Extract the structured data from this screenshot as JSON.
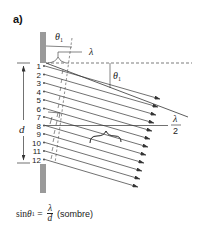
{
  "panel_label": "a)",
  "labels": {
    "theta_top": "θ",
    "theta_top_sub": "1",
    "lambda": "λ",
    "theta_mid": "θ",
    "theta_mid_sub": "1",
    "d": "d",
    "half_lambda_num": "λ",
    "half_lambda_den": "2"
  },
  "sources": [
    "1",
    "2",
    "3",
    "4",
    "5",
    "6",
    "7",
    "8",
    "9",
    "10",
    "11",
    "12"
  ],
  "formula": {
    "lhs": "sin ",
    "theta": "θ",
    "sub": "1",
    "eq": " = ",
    "num": "λ",
    "den": "d",
    "note": "(sombre)"
  },
  "colors": {
    "wall": "#9a9a9a",
    "line": "#333333",
    "dashed": "#444444",
    "text": "#222222"
  }
}
